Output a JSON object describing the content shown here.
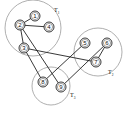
{
  "diagram": {
    "type": "clustered-graph",
    "clusters": [
      {
        "id": "T1",
        "label": "T",
        "subscript": "1",
        "cx": 33,
        "cy": 28,
        "r": 28,
        "label_x": 54,
        "label_y": 12
      },
      {
        "id": "T2",
        "label": "T",
        "subscript": "2",
        "cx": 98,
        "cy": 52,
        "r": 24,
        "label_x": 108,
        "label_y": 74
      },
      {
        "id": "T3",
        "label": "T",
        "subscript": "3",
        "cx": 51,
        "cy": 86,
        "r": 19,
        "label_x": 70,
        "label_y": 97
      }
    ],
    "nodes": [
      {
        "id": "1",
        "label": "1",
        "x": 35,
        "y": 16
      },
      {
        "id": "2",
        "label": "2",
        "x": 20,
        "y": 25
      },
      {
        "id": "3",
        "label": "3",
        "x": 24,
        "y": 48
      },
      {
        "id": "4",
        "label": "4",
        "x": 49,
        "y": 27
      },
      {
        "id": "5",
        "label": "5",
        "x": 85,
        "y": 43
      },
      {
        "id": "6",
        "label": "6",
        "x": 107,
        "y": 43
      },
      {
        "id": "7",
        "label": "7",
        "x": 96,
        "y": 62
      },
      {
        "id": "8",
        "label": "8",
        "x": 43,
        "y": 82
      },
      {
        "id": "9",
        "label": "9",
        "x": 61,
        "y": 87
      }
    ],
    "edges": [
      [
        "1",
        "2"
      ],
      [
        "2",
        "4"
      ],
      [
        "2",
        "3"
      ],
      [
        "2",
        "9"
      ],
      [
        "3",
        "8"
      ],
      [
        "3",
        "7"
      ],
      [
        "5",
        "8"
      ],
      [
        "6",
        "7"
      ],
      [
        "6",
        "9"
      ]
    ],
    "colors": {
      "cluster_stroke": "#9a9a9a",
      "edge_stroke": "#222222",
      "background": "#ffffff"
    }
  }
}
